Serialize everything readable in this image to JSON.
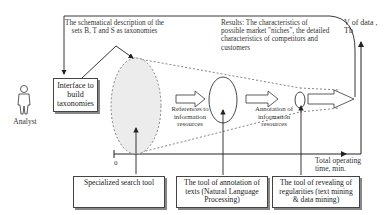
{
  "actor": {
    "label": "Analyst"
  },
  "interface_box": {
    "label": "Interface to build taxonomies"
  },
  "taxonomy_note": {
    "label": "The schematical description of the sets B, T and S as taxonomies"
  },
  "results_note": {
    "label": "Results: The characteristics of possible market \"niches\", the detailed characteristics of competitors and customers"
  },
  "axes": {
    "y_label": "V of data , Tb",
    "x_label": "Total operating time, min.",
    "origin": "0"
  },
  "stages": [
    {
      "label": "References to information resources"
    },
    {
      "label": "Annotation of information resources"
    }
  ],
  "tools": [
    {
      "label": "Specialized search tool"
    },
    {
      "label": "The tool of annotation of texts (Natural Language Processing)"
    },
    {
      "label": "The tool of revealing of regularities (text mining & data mining)"
    }
  ]
}
